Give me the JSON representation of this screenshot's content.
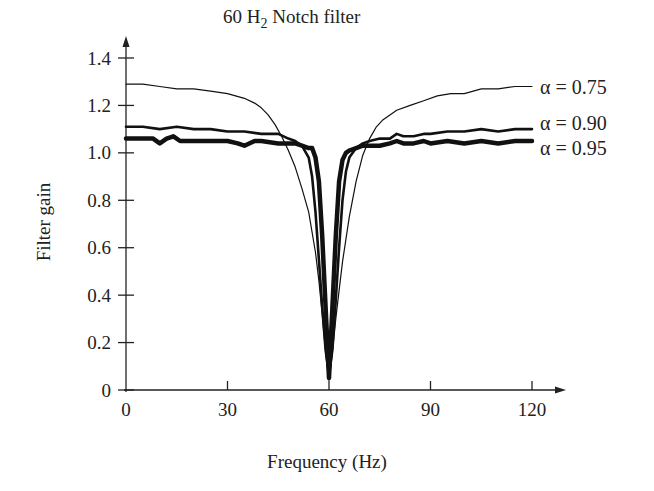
{
  "chart_data": {
    "type": "line",
    "title": "60 H2 Notch filter",
    "title_parts": {
      "prefix": "60 H",
      "subscript": "2",
      "suffix": " Notch filter"
    },
    "xlabel": "Frequency (Hz)",
    "ylabel": "Filter gain",
    "xlim": [
      0,
      120
    ],
    "ylim": [
      0,
      1.4
    ],
    "xticks": [
      0,
      30,
      60,
      90,
      120
    ],
    "xtick_labels": [
      "0",
      "30",
      "60",
      "90",
      "120"
    ],
    "yticks": [
      0,
      0.2,
      0.4,
      0.6,
      0.8,
      1.0,
      1.2,
      1.4
    ],
    "ytick_labels": [
      "0",
      "0.2",
      "0.4",
      "0.6",
      "0.8",
      "1.0",
      "1.2",
      "1.4"
    ],
    "grid": false,
    "legend_position": "right, inline labels at series end",
    "series": [
      {
        "name": "α = 0.75",
        "stroke_width": 1.2,
        "x": [
          0,
          5,
          10,
          15,
          20,
          25,
          30,
          35,
          38,
          40,
          42,
          44,
          46,
          48,
          50,
          52,
          54,
          56,
          57,
          58,
          59,
          60,
          61,
          62,
          63,
          64,
          66,
          68,
          70,
          72,
          74,
          76,
          78,
          80,
          84,
          88,
          92,
          96,
          100,
          105,
          110,
          115,
          120
        ],
        "y": [
          1.29,
          1.29,
          1.28,
          1.27,
          1.27,
          1.26,
          1.25,
          1.23,
          1.21,
          1.19,
          1.16,
          1.12,
          1.07,
          1.01,
          0.94,
          0.85,
          0.75,
          0.58,
          0.46,
          0.32,
          0.16,
          0.04,
          0.16,
          0.3,
          0.42,
          0.54,
          0.73,
          0.88,
          0.99,
          1.06,
          1.11,
          1.14,
          1.16,
          1.18,
          1.2,
          1.22,
          1.24,
          1.25,
          1.25,
          1.27,
          1.27,
          1.28,
          1.28
        ]
      },
      {
        "name": "α = 0.90",
        "stroke_width": 2.6,
        "x": [
          0,
          5,
          10,
          15,
          20,
          25,
          30,
          35,
          40,
          45,
          48,
          50,
          52,
          54,
          55,
          56,
          57,
          58,
          59,
          60,
          61,
          62,
          63,
          64,
          65,
          66,
          68,
          70,
          72,
          75,
          78,
          80,
          82,
          85,
          88,
          90,
          95,
          100,
          105,
          110,
          115,
          120
        ],
        "y": [
          1.11,
          1.11,
          1.1,
          1.11,
          1.1,
          1.1,
          1.09,
          1.09,
          1.08,
          1.08,
          1.06,
          1.05,
          1.03,
          0.98,
          0.9,
          0.75,
          0.55,
          0.35,
          0.17,
          0.06,
          0.17,
          0.38,
          0.6,
          0.8,
          0.92,
          0.98,
          1.02,
          1.04,
          1.05,
          1.06,
          1.06,
          1.08,
          1.07,
          1.07,
          1.08,
          1.08,
          1.09,
          1.09,
          1.1,
          1.09,
          1.1,
          1.1
        ]
      },
      {
        "name": "α = 0.95",
        "stroke_width": 4.5,
        "x": [
          0,
          4,
          8,
          10,
          12,
          14,
          16,
          18,
          20,
          25,
          30,
          33,
          35,
          38,
          40,
          45,
          50,
          52,
          54,
          55,
          56,
          57,
          58,
          59,
          60,
          61,
          62,
          63,
          64,
          65,
          66,
          68,
          70,
          72,
          75,
          78,
          80,
          82,
          85,
          88,
          90,
          95,
          100,
          105,
          110,
          115,
          120
        ],
        "y": [
          1.06,
          1.06,
          1.06,
          1.04,
          1.06,
          1.07,
          1.05,
          1.05,
          1.05,
          1.05,
          1.05,
          1.04,
          1.03,
          1.05,
          1.05,
          1.04,
          1.04,
          1.03,
          1.02,
          1.02,
          0.98,
          0.88,
          0.65,
          0.35,
          0.05,
          0.35,
          0.65,
          0.88,
          0.97,
          1.0,
          1.01,
          1.02,
          1.03,
          1.03,
          1.03,
          1.04,
          1.05,
          1.04,
          1.04,
          1.05,
          1.04,
          1.05,
          1.04,
          1.05,
          1.04,
          1.05,
          1.05
        ]
      }
    ]
  },
  "colors": {
    "line": "#111111",
    "axis": "#222222",
    "background": "#ffffff"
  }
}
